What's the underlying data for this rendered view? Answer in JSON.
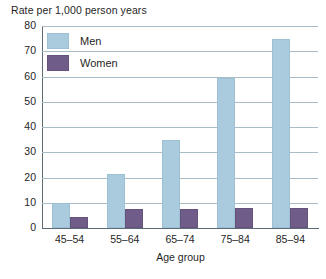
{
  "chart_data": {
    "type": "bar",
    "title": "Rate per 1,000 person years",
    "xlabel": "Age group",
    "ylabel": "Rate per 1,000 person years",
    "categories": [
      "45–54",
      "55–64",
      "65–74",
      "75–84",
      "85–94"
    ],
    "series": [
      {
        "name": "Men",
        "color": "#a9cbdd",
        "values": [
          10,
          21.5,
          35,
          59.5,
          75
        ]
      },
      {
        "name": "Women",
        "color": "#6f5c88",
        "values": [
          4.2,
          7.5,
          7.6,
          7.8,
          8
        ]
      }
    ],
    "ylim": [
      0,
      80
    ],
    "yticks": [
      0,
      10,
      20,
      30,
      40,
      50,
      60,
      70,
      80
    ],
    "ytick_labels": [
      "0",
      "10",
      "20",
      "30",
      "40",
      "50",
      "60",
      "70",
      "80"
    ],
    "grid": "horizontal",
    "legend_position": "top-left",
    "gridline_color": "#a8bcc8",
    "axis_color": "#5d6b75",
    "background": "#ffffff"
  },
  "legend": {
    "items": [
      {
        "label": "Men"
      },
      {
        "label": "Women"
      }
    ]
  }
}
